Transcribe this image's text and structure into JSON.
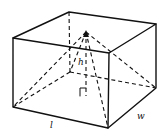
{
  "figure": {
    "labels": {
      "length": "l",
      "width": "w",
      "height": "h"
    },
    "colors": {
      "line": "#111111",
      "background": "#ffffff"
    }
  }
}
